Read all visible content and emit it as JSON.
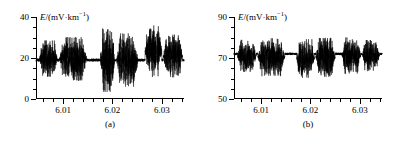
{
  "figure": {
    "panels": [
      {
        "caption": "(a)",
        "axis_title_prefix": "E",
        "axis_title_rest": "/(mV·km",
        "axis_title_sup": "−1",
        "axis_title_close": ")"
      },
      {
        "caption": "(b)",
        "axis_title_prefix": "E",
        "axis_title_rest": "/(mV·km",
        "axis_title_sup": "−1",
        "axis_title_close": ")"
      }
    ]
  },
  "chart_data": [
    {
      "type": "line",
      "title": "",
      "panel_label": "(a)",
      "xlabel": "",
      "ylabel": "E/(mV·km⁻¹)",
      "xlim": [
        6.0045,
        6.0345
      ],
      "ylim": [
        0,
        40
      ],
      "ytick_values": [
        0,
        20,
        40
      ],
      "ytick_labels": [
        "0",
        "20",
        "40"
      ],
      "y_minor_count": 3,
      "xtick_values": [
        6.01,
        6.02,
        6.03
      ],
      "xtick_labels": [
        "6.01",
        "6.02",
        "6.03"
      ],
      "x_minor_count": 4,
      "grid": false,
      "legend": null,
      "baseline": 19.0,
      "series": [
        {
          "name": "geoelectric field E",
          "description": "high-frequency noise trace with alternating quiet baseline segments and dense burst segments",
          "quiet_noise_amplitude": 0.7,
          "burst_segments": [
            {
              "x_start": 6.0052,
              "x_end": 6.0088,
              "amp_low": 13.0,
              "amp_high": 26.5
            },
            {
              "x_start": 6.0092,
              "x_end": 6.0148,
              "amp_low": 11.5,
              "amp_high": 27.5
            },
            {
              "x_start": 6.0175,
              "x_end": 6.0205,
              "amp_low": 7.0,
              "amp_high": 30.5
            },
            {
              "x_start": 6.0208,
              "x_end": 6.0252,
              "amp_low": 9.0,
              "amp_high": 29.0
            },
            {
              "x_start": 6.0266,
              "x_end": 6.03,
              "amp_low": 14.0,
              "amp_high": 33.0
            },
            {
              "x_start": 6.0303,
              "x_end": 6.0342,
              "amp_low": 13.0,
              "amp_high": 29.0
            }
          ],
          "quiet_segments": [
            {
              "x_start": 6.0045,
              "x_end": 6.0052
            },
            {
              "x_start": 6.0148,
              "x_end": 6.0175
            },
            {
              "x_start": 6.0252,
              "x_end": 6.0266
            }
          ]
        }
      ]
    },
    {
      "type": "line",
      "title": "",
      "panel_label": "(b)",
      "xlabel": "",
      "ylabel": "E/(mV·km⁻¹)",
      "xlim": [
        6.0045,
        6.0345
      ],
      "ylim": [
        50,
        90
      ],
      "ytick_values": [
        50,
        70,
        90
      ],
      "ytick_labels": [
        "50",
        "70",
        "90"
      ],
      "y_minor_count": 3,
      "xtick_values": [
        6.01,
        6.02,
        6.03
      ],
      "xtick_labels": [
        "6.01",
        "6.02",
        "6.03"
      ],
      "x_minor_count": 4,
      "grid": false,
      "legend": null,
      "baseline": 72.0,
      "series": [
        {
          "name": "geoelectric field E",
          "description": "high-frequency noise trace with alternating quiet baseline segments and dense burst segments",
          "quiet_noise_amplitude": 0.6,
          "burst_segments": [
            {
              "x_start": 6.0052,
              "x_end": 6.009,
              "amp_low": 65.0,
              "amp_high": 77.0
            },
            {
              "x_start": 6.0093,
              "x_end": 6.0148,
              "amp_low": 63.5,
              "amp_high": 77.5
            },
            {
              "x_start": 6.0172,
              "x_end": 6.0208,
              "amp_low": 62.5,
              "amp_high": 77.0
            },
            {
              "x_start": 6.0211,
              "x_end": 6.025,
              "amp_low": 63.0,
              "amp_high": 77.5
            },
            {
              "x_start": 6.0264,
              "x_end": 6.0302,
              "amp_low": 64.5,
              "amp_high": 78.0
            },
            {
              "x_start": 6.0305,
              "x_end": 6.034,
              "amp_low": 65.5,
              "amp_high": 77.0
            }
          ],
          "quiet_segments": [
            {
              "x_start": 6.0045,
              "x_end": 6.0052
            },
            {
              "x_start": 6.0148,
              "x_end": 6.0172
            },
            {
              "x_start": 6.025,
              "x_end": 6.0264
            }
          ]
        }
      ]
    }
  ]
}
